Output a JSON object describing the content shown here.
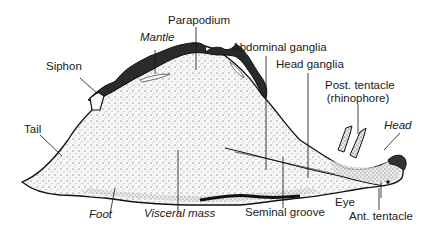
{
  "diagram": {
    "labels": {
      "parapodium": "Parapodium",
      "mantle": "Mantle",
      "siphon": "Siphon",
      "abdominal_ganglia": "Abdominal ganglia",
      "head_ganglia": "Head ganglia",
      "post_tentacle_line1": "Post. tentacle",
      "post_tentacle_line2": "(rhinophore)",
      "head": "Head",
      "tail": "Tail",
      "foot": "Foot",
      "visceral_mass": "Visceral mass",
      "seminal_groove": "Seminal groove",
      "eye": "Eye",
      "ant_tentacle": "Ant. tentacle"
    },
    "italic_labels": [
      "Mantle",
      "Head",
      "Foot",
      "Visceral mass"
    ],
    "colors": {
      "outline": "#111111",
      "mantle_fill": "#2a2a2a",
      "body_fill": "#f4f4f4",
      "stipple": "#333333",
      "text": "#1a1a1a"
    }
  }
}
